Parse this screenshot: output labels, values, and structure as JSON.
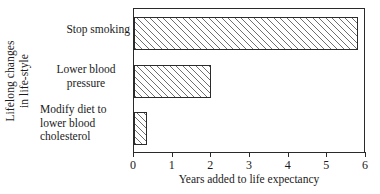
{
  "chart_data": {
    "type": "bar",
    "orientation": "horizontal",
    "title": "",
    "xlabel": "Years added to life expectancy",
    "ylabel_line1": "Lifelong changes",
    "ylabel_line2": "in life-style",
    "categories": [
      "Stop smoking",
      "Lower blood\npressure",
      "Modify diet to\nlower blood\ncholesterol"
    ],
    "values": [
      5.8,
      2.0,
      0.33
    ],
    "xlim": [
      0,
      6
    ],
    "xticks": [
      0,
      1,
      2,
      3,
      4,
      5,
      6
    ],
    "xtick_labels": [
      "0",
      "1",
      "2",
      "3",
      "4",
      "5",
      "6"
    ],
    "grid": false,
    "legend": false,
    "bar_fill": "hatched-diagonal",
    "bar_edge_color": "#2b2b2b",
    "hatch_color": "#6f6f6f",
    "frame_color": "#2a2a2a",
    "background": "#ffffff"
  }
}
